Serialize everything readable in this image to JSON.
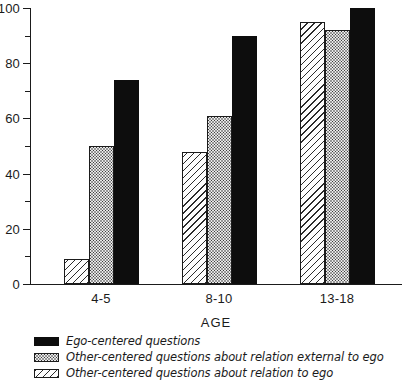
{
  "chart_data": {
    "type": "bar",
    "title": "",
    "xlabel": "AGE",
    "ylabel": "",
    "categories": [
      "4-5",
      "8-10",
      "13-18"
    ],
    "ylim": [
      0,
      100
    ],
    "yticks": [
      0,
      20,
      40,
      60,
      80,
      100
    ],
    "yticks_minor": [
      10,
      30,
      50,
      70,
      90
    ],
    "ytick_labels": [
      "0",
      "20",
      "40",
      "60",
      "80",
      "100"
    ],
    "grid": false,
    "legend_position": "below-plot",
    "series": [
      {
        "name": "Other-centered questions about relation to ego",
        "pattern": "diagonal-hatch",
        "color": "#fdfdfd",
        "values": [
          9,
          48,
          95
        ]
      },
      {
        "name": "Other-centered questions about relation external to ego",
        "pattern": "dotted",
        "color": "#e9e9e9",
        "values": [
          50,
          61,
          92
        ]
      },
      {
        "name": "Ego-centered questions",
        "pattern": "solid",
        "color": "#0d0d0d",
        "values": [
          74,
          90,
          100
        ]
      }
    ]
  },
  "axis": {
    "x_title": "AGE",
    "x_labels": [
      "4-5",
      "8-10",
      "13-18"
    ],
    "y_labels": [
      "0",
      "20",
      "40",
      "60",
      "80",
      "100"
    ]
  },
  "legend": {
    "items": [
      {
        "swatch": "solid",
        "label": "Ego-centered questions"
      },
      {
        "swatch": "dotted",
        "label": "Other-centered questions about relation external to ego"
      },
      {
        "swatch": "hatched",
        "label": "Other-centered questions about relation to ego"
      }
    ]
  }
}
